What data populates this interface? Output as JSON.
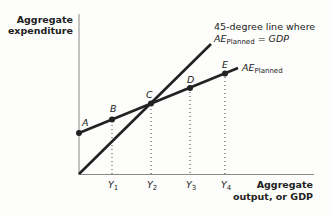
{
  "diagram": {
    "y_axis_title": [
      "Aggregate",
      "expenditure"
    ],
    "x_axis_title": [
      "Aggregate",
      "output, or GDP"
    ],
    "line_45_label": {
      "line1": "45-degree line where",
      "ae": "AE",
      "sub": "Planned",
      "rest": " = GDP"
    },
    "ae_planned_label": {
      "ae": "AE",
      "sub": "Planned"
    },
    "points": [
      {
        "label": "A",
        "x": 79,
        "y": 133
      },
      {
        "label": "B",
        "x": 112,
        "y": 119
      },
      {
        "label": "C",
        "x": 151,
        "y": 103
      },
      {
        "label": "D",
        "x": 190,
        "y": 90
      },
      {
        "label": "E",
        "x": 225,
        "y": 75
      }
    ],
    "x_ticks": [
      {
        "label": "Y",
        "sub": "1",
        "x": 112
      },
      {
        "label": "Y",
        "sub": "2",
        "x": 151
      },
      {
        "label": "Y",
        "sub": "3",
        "x": 190
      },
      {
        "label": "Y",
        "sub": "4",
        "x": 225
      }
    ],
    "colors": {
      "line": "#222222",
      "axis": "#777777",
      "dots": "#555555"
    }
  }
}
